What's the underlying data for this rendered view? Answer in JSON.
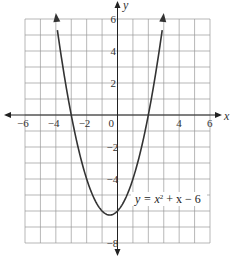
{
  "chart_data": {
    "type": "line",
    "title": "",
    "equation": "y = x² + x − 6",
    "equation_parts": {
      "lhs": "y = x",
      "exp": "2",
      "rhs": " + x − 6"
    },
    "xlabel": "x",
    "ylabel": "y",
    "xlim": [
      -6,
      6
    ],
    "ylim": [
      -8,
      6
    ],
    "grid": true,
    "x_tick_labels": [
      "−6",
      "−4",
      "−2",
      "0",
      "4",
      "6"
    ],
    "y_tick_labels": [
      "6",
      "4",
      "2",
      "−2",
      "−4",
      "−8"
    ],
    "series": [
      {
        "name": "y = x^2 + x - 6",
        "x": [
          -4,
          -3.5,
          -3,
          -2.5,
          -2,
          -1.5,
          -1,
          -0.5,
          0,
          0.5,
          1,
          1.5,
          2,
          2.5,
          3
        ],
        "y": [
          6,
          2.75,
          0,
          -2.25,
          -4,
          -5.25,
          -6,
          -6.25,
          -6,
          -5.25,
          -4,
          -2.25,
          0,
          2.75,
          6
        ]
      }
    ],
    "colors": {
      "curve": "#333333",
      "grid": "#999999",
      "axes": "#222222"
    }
  }
}
